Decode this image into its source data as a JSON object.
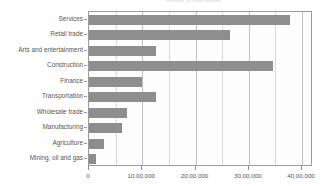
{
  "chart_data": {
    "type": "bar",
    "orientation": "horizontal",
    "title": "Number of businesses",
    "xlabel": "",
    "ylabel": "",
    "categories": [
      "Services",
      "Retail trade",
      "Arts and  entertainment",
      "Construction",
      "Finance",
      "Transportation",
      "Wholesale trade",
      "Manufacturing",
      "Agriculture",
      "Mining, oil and gas"
    ],
    "values": [
      3780000,
      2650000,
      1260000,
      3450000,
      1000000,
      1250000,
      720000,
      620000,
      280000,
      130000
    ],
    "xlim": [
      0,
      4000000
    ],
    "xticks": [
      0,
      1000000,
      2000000,
      3000000,
      4000000
    ],
    "xtick_labels": [
      "0",
      "10,00,000",
      "20,00,000",
      "30,00,000",
      "40,00,000"
    ],
    "minor_xticks": [
      500000,
      1500000,
      2500000,
      3500000
    ],
    "grid": true,
    "legend": "none",
    "bar_color": "#8e8e8e",
    "plot_border_color": "#9a9a9a",
    "gridline_color": "#bfbfbf",
    "background_color": "#ffffff"
  }
}
